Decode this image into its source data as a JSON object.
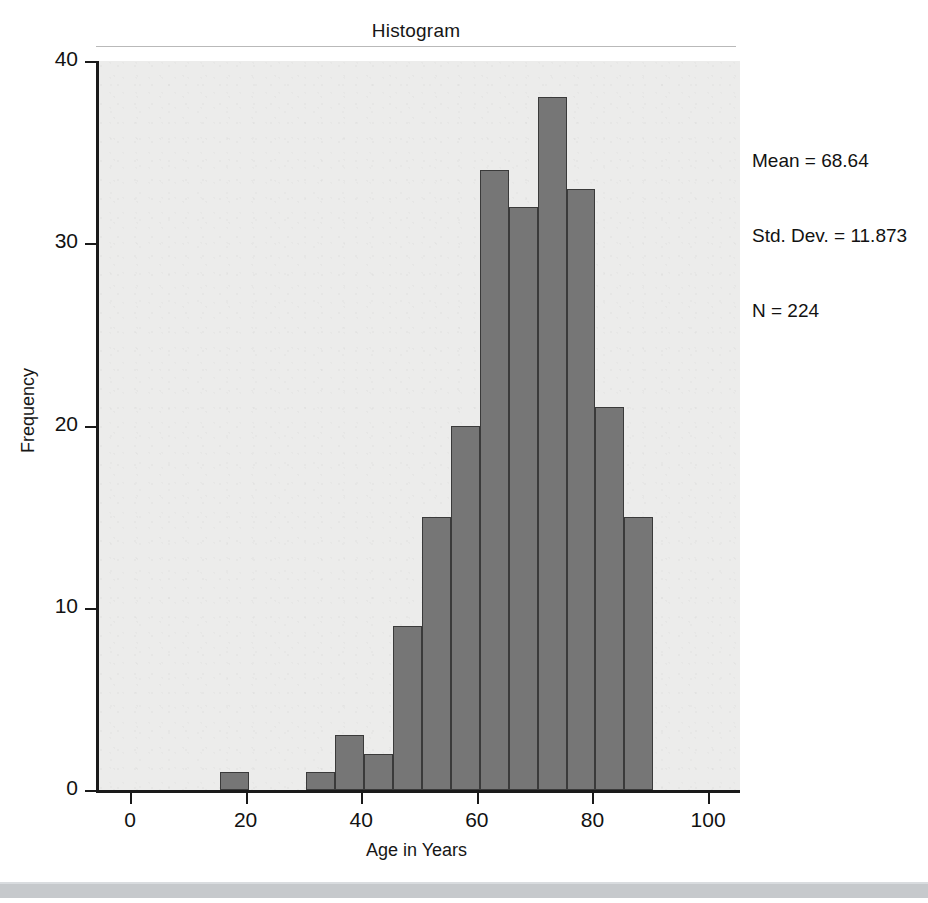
{
  "chart_data": {
    "type": "bar",
    "title": "Histogram",
    "xlabel": "Age in Years",
    "ylabel": "Frequency",
    "xlim": [
      0,
      105
    ],
    "ylim": [
      0,
      40
    ],
    "grid": false,
    "legend": null,
    "bin_width": 5,
    "bins": [
      {
        "start": 15,
        "end": 20,
        "value": 1
      },
      {
        "start": 30,
        "end": 35,
        "value": 1
      },
      {
        "start": 35,
        "end": 40,
        "value": 3
      },
      {
        "start": 40,
        "end": 45,
        "value": 2
      },
      {
        "start": 45,
        "end": 50,
        "value": 9
      },
      {
        "start": 50,
        "end": 55,
        "value": 15
      },
      {
        "start": 55,
        "end": 60,
        "value": 20
      },
      {
        "start": 60,
        "end": 65,
        "value": 34
      },
      {
        "start": 65,
        "end": 70,
        "value": 32
      },
      {
        "start": 70,
        "end": 75,
        "value": 38
      },
      {
        "start": 75,
        "end": 80,
        "value": 33
      },
      {
        "start": 80,
        "end": 85,
        "value": 21
      },
      {
        "start": 85,
        "end": 90,
        "value": 15
      }
    ],
    "categories": [
      "15-20",
      "30-35",
      "35-40",
      "40-45",
      "45-50",
      "50-55",
      "55-60",
      "60-65",
      "65-70",
      "70-75",
      "75-80",
      "80-85",
      "85-90"
    ],
    "values": [
      1,
      1,
      3,
      2,
      9,
      15,
      20,
      34,
      32,
      38,
      33,
      21,
      15
    ],
    "xticks": [
      0,
      20,
      40,
      60,
      80,
      100
    ],
    "yticks": [
      0,
      10,
      20,
      30,
      40
    ],
    "annotations": {
      "mean_label": "Mean = 68.64",
      "std_label": "Std. Dev. = 11.873",
      "n_label": "N = 224",
      "mean": 68.64,
      "std_dev": 11.873,
      "n": 224
    },
    "colors": {
      "bar_fill": "#767676",
      "bar_edge": "#3a3a3a",
      "panel_background": "#ececeb",
      "axis": "#1a1a1a",
      "text": "#121212"
    }
  }
}
